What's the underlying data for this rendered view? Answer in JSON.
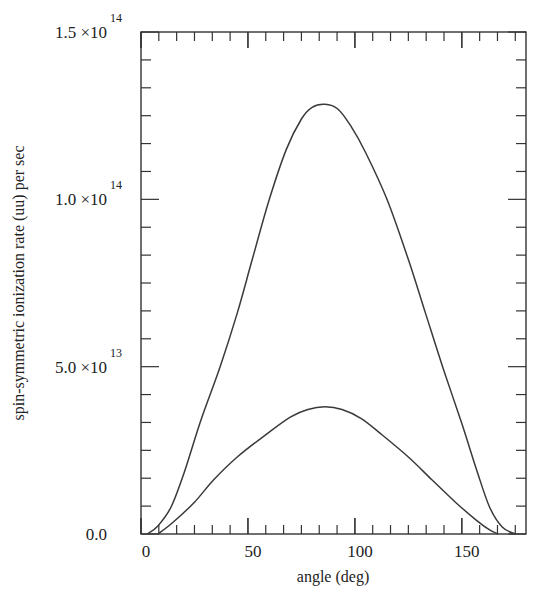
{
  "chart_data": {
    "type": "line",
    "title": "",
    "xlabel": "angle (deg)",
    "ylabel": "spin-symmetric ionization rate (uu) per sec",
    "xlim": [
      0,
      180
    ],
    "ylim": [
      0,
      150000000000000.0
    ],
    "grid": false,
    "legend": null,
    "x_ticks": [
      {
        "value": 0,
        "label": "0"
      },
      {
        "value": 50,
        "label": "50"
      },
      {
        "value": 100,
        "label": "100"
      },
      {
        "value": 150,
        "label": "150"
      }
    ],
    "y_ticks": [
      {
        "value": 0,
        "mantissa": "0.0",
        "exponent": ""
      },
      {
        "value": 50000000000000.0,
        "mantissa": "5.0 ×10",
        "exponent": "13"
      },
      {
        "value": 100000000000000.0,
        "mantissa": "1.0 ×10",
        "exponent": "14"
      },
      {
        "value": 150000000000000.0,
        "mantissa": "1.5 ×10",
        "exponent": "14"
      }
    ],
    "series": [
      {
        "name": "upper curve",
        "x": [
          3,
          8,
          14,
          20,
          28,
          37,
          45,
          52,
          60,
          68,
          75,
          80,
          86,
          92,
          98,
          105,
          115,
          125,
          133,
          141,
          150,
          157,
          163,
          169,
          175
        ],
        "values": [
          0,
          2500000000000.0,
          8000000000000.0,
          18000000000000.0,
          34000000000000.0,
          50000000000000.0,
          66000000000000.0,
          82000000000000.0,
          100000000000000.0,
          115000000000000.0,
          124000000000000.0,
          127500000000000.0,
          128400000000000.0,
          127000000000000.0,
          122000000000000.0,
          114000000000000.0,
          100000000000000.0,
          82000000000000.0,
          66000000000000.0,
          50000000000000.0,
          33000000000000.0,
          19000000000000.0,
          8000000000000.0,
          2000000000000.0,
          0
        ]
      },
      {
        "name": "lower curve",
        "x": [
          8,
          15,
          25,
          34,
          45,
          59,
          70,
          78,
          86,
          94,
          103,
          112,
          125,
          136,
          147,
          157,
          163,
          167
        ],
        "values": [
          0,
          3500000000000.0,
          9500000000000.0,
          16200000000000.0,
          23000000000000.0,
          30000000000000.0,
          35000000000000.0,
          37200000000000.0,
          38000000000000.0,
          37200000000000.0,
          34500000000000.0,
          30000000000000.0,
          23000000000000.0,
          16200000000000.0,
          9500000000000.0,
          4000000000000.0,
          1200000000000.0,
          0
        ]
      }
    ],
    "minor_x_step": 8.333,
    "minor_y_step": 8333000000000.0
  }
}
